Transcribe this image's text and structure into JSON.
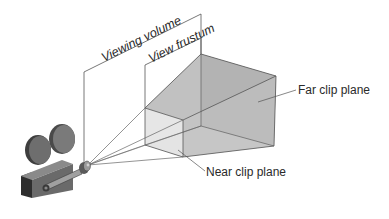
{
  "diagram": {
    "labels": {
      "viewing_volume": "Viewing volume",
      "view_frustum": "View frustum",
      "far_clip_plane": "Far clip plane",
      "near_clip_plane": "Near clip plane"
    },
    "colors": {
      "line": "#555555",
      "far_face": "#a9a9a9",
      "top_face": "#b5b5b5",
      "side_face": "#bdbdbd",
      "bottom_face": "#c4c4c4",
      "near_face": "#e4e4e4",
      "camera_dark": "#3a3a3a",
      "camera_mid": "#6a6a6a",
      "camera_light": "#9a9a9a"
    }
  }
}
